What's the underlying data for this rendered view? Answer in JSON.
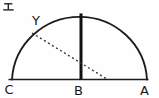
{
  "figure": {
    "type": "geometry-diagram",
    "option_label": "エ",
    "point_labels": {
      "arc_point": "Y",
      "diameter_left": "C",
      "diameter_center": "B",
      "diameter_right": "A"
    },
    "colors": {
      "ink": "#1c1c1c",
      "dashed_ink": "#333333",
      "background": "#fefefe"
    },
    "geometry": {
      "diameter_line": {
        "x1": 8.5,
        "y1": 79.5,
        "x2": 148.5,
        "y2": 79.5
      },
      "semicircle_arc": {
        "left_x": 12,
        "right_x": 147,
        "base_y": 79.5,
        "top_y": 13.2
      },
      "radius_line": {
        "x": 81,
        "y1": 13.4,
        "y2": 79.5
      },
      "dashed_segment": {
        "x1": 32,
        "y1": 33,
        "x2": 106.5,
        "y2": 78.8
      }
    }
  }
}
